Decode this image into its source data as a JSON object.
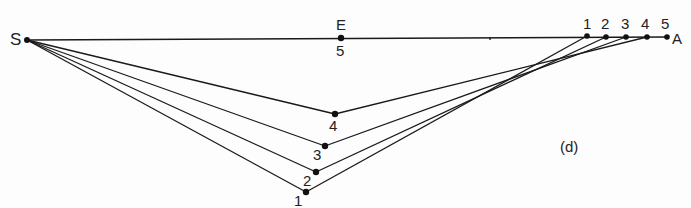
{
  "diagram": {
    "panel_label": "(d)",
    "points": {
      "S": {
        "label": "S",
        "x": 27,
        "y": 40
      },
      "E": {
        "label": "E",
        "sub": "5",
        "x": 341,
        "y": 38
      },
      "A": {
        "label": "A"
      }
    },
    "top_points": [
      {
        "label": "1",
        "x": 587,
        "y": 36
      },
      {
        "label": "2",
        "x": 606,
        "y": 37
      },
      {
        "label": "3",
        "x": 626,
        "y": 37
      },
      {
        "label": "4",
        "x": 647,
        "y": 37
      },
      {
        "label": "5",
        "x": 667,
        "y": 37
      }
    ],
    "bottom_points": [
      {
        "label": "1",
        "x": 306,
        "y": 192
      },
      {
        "label": "2",
        "x": 316,
        "y": 172
      },
      {
        "label": "3",
        "x": 325,
        "y": 146
      },
      {
        "label": "4",
        "x": 335,
        "y": 114
      }
    ]
  }
}
